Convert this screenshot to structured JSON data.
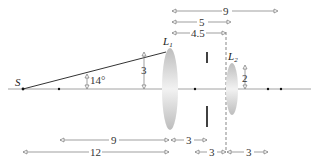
{
  "diagram": {
    "type": "optics-two-lens-system",
    "colors": {
      "axis": "#8a8a8a",
      "ray": "#333333",
      "dim_line": "#777777",
      "lens": "#c8c8c8",
      "stop": "#111111"
    },
    "labels": {
      "source": "S",
      "lens1": "L",
      "lens1_sub": "1",
      "lens2": "L",
      "lens2_sub": "2",
      "angle": "14°",
      "height1": "3",
      "height2": "2"
    },
    "top_dimensions": [
      {
        "label": "9",
        "from": "L1",
        "to": "right focal point"
      },
      {
        "label": "5",
        "from": "L1",
        "to": "L2"
      },
      {
        "label": "4.5",
        "from": "L1",
        "to": "dashed plane"
      }
    ],
    "bottom_dimensions": [
      {
        "label": "9",
        "row": 1
      },
      {
        "label": "3",
        "row": 1
      },
      {
        "label": "12",
        "row": 2
      },
      {
        "label": "3",
        "row": 2,
        "position": "left-of-dashed"
      },
      {
        "label": "3",
        "row": 2,
        "position": "right-of-dashed"
      }
    ]
  }
}
